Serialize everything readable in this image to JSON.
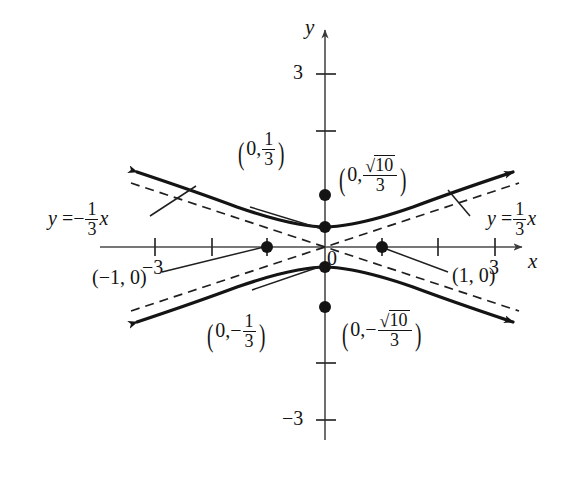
{
  "figure": {
    "kind": "hyperbola-graph",
    "axes": {
      "x_axis_label": "x",
      "y_axis_label": "y",
      "origin_label": "0",
      "x_ticks": [
        {
          "value": -3,
          "label": "−3"
        },
        {
          "value": -2,
          "label": ""
        },
        {
          "value": -1,
          "label": ""
        },
        {
          "value": 1,
          "label": ""
        },
        {
          "value": 2,
          "label": ""
        },
        {
          "value": 3,
          "label": "3"
        }
      ],
      "y_ticks": [
        {
          "value": 3,
          "label": "3"
        },
        {
          "value": 2,
          "label": ""
        },
        {
          "value": -2,
          "label": ""
        },
        {
          "value": -3,
          "label": "−3"
        }
      ],
      "x_range": [
        -3.5,
        3.5
      ],
      "y_range": [
        -3.5,
        3.5
      ]
    },
    "asymptotes": [
      {
        "name": "negative-slope-asymptote",
        "slope": -0.3333,
        "equation_parts": {
          "lhs": "y",
          "eq": "=",
          "sign": "−",
          "num": "1",
          "den": "3",
          "var": "x"
        }
      },
      {
        "name": "positive-slope-asymptote",
        "slope": 0.3333,
        "equation_parts": {
          "lhs": "y",
          "eq": "=",
          "sign": "",
          "num": "1",
          "den": "3",
          "var": "x"
        }
      }
    ],
    "points": [
      {
        "name": "vertex-upper",
        "x": 0,
        "y": 0.3333,
        "label_parts": {
          "open": "(",
          "x": "0,",
          "sign": "",
          "num": "1",
          "den": "3",
          "close": ")"
        }
      },
      {
        "name": "vertex-lower",
        "x": 0,
        "y": -0.3333,
        "label_parts": {
          "open": "(",
          "x": "0,",
          "sign": "−",
          "num": "1",
          "den": "3",
          "close": ")"
        }
      },
      {
        "name": "focus-upper",
        "x": 0,
        "y": 1.0541,
        "label_parts": {
          "open": "(",
          "x": "0,",
          "sign": "",
          "radicand": "10",
          "den": "3",
          "close": ")"
        }
      },
      {
        "name": "focus-lower",
        "x": 0,
        "y": -1.0541,
        "label_parts": {
          "open": "(",
          "x": "0,",
          "sign": "−",
          "radicand": "10",
          "den": "3",
          "close": ")"
        }
      },
      {
        "name": "point-left",
        "x": -1,
        "y": 0,
        "label": "(−1, 0)"
      },
      {
        "name": "point-right",
        "x": 1,
        "y": 0,
        "label": "(1, 0)"
      }
    ],
    "curve": {
      "description": "vertical hyperbola opening up and down, vertices at (0, ±1/3)",
      "a": 0.3333,
      "b": 1
    },
    "colors": {
      "ink": "#141414",
      "axis": "#3a3a3a",
      "background": "#ffffff"
    }
  }
}
